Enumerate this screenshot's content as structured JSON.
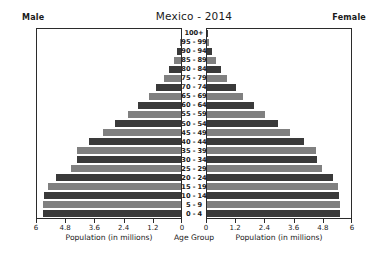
{
  "header": {
    "male_label": "Male",
    "female_label": "Female",
    "title": "Mexico - 2014"
  },
  "axis": {
    "left_title": "Population (in millions)",
    "right_title": "Population (in millions)",
    "center_title": "Age Group",
    "left_ticks": [
      "6",
      "4.8",
      "3.6",
      "2.4",
      "1.2",
      "0"
    ],
    "right_ticks": [
      "0",
      "1.2",
      "2.4",
      "3.6",
      "4.8",
      "6"
    ]
  },
  "colors": {
    "bar_dark": "#3a3a3a",
    "bar_light": "#808080",
    "axis": "#2b2b2b",
    "background": "#ffffff",
    "text": "#1a1a1a"
  },
  "chart_data": {
    "type": "bar",
    "subtype": "population-pyramid",
    "title": "Mexico - 2014",
    "xlabel": "Population (in millions)",
    "ylabel": "Age Group",
    "xlim": [
      0,
      6
    ],
    "xticks": [
      0,
      1.2,
      2.4,
      3.6,
      4.8,
      6
    ],
    "grid": false,
    "legend": "none",
    "orientation": "horizontal",
    "left_series_name": "Male",
    "right_series_name": "Female",
    "categories": [
      "0 - 4",
      "5 - 9",
      "10 - 14",
      "15 - 19",
      "20 - 24",
      "25 - 29",
      "30 - 34",
      "35 - 39",
      "40 - 44",
      "45 - 49",
      "50 - 54",
      "55 - 59",
      "60 - 64",
      "65 - 69",
      "70 - 74",
      "75 - 79",
      "80 - 84",
      "85 - 89",
      "90 - 94",
      "95 - 99",
      "100+"
    ],
    "series": [
      {
        "name": "Male",
        "values": [
          5.75,
          5.75,
          5.7,
          5.55,
          5.2,
          4.6,
          4.35,
          4.35,
          3.85,
          3.25,
          2.75,
          2.2,
          1.8,
          1.35,
          1.05,
          0.72,
          0.5,
          0.3,
          0.15,
          0.05,
          0.02
        ]
      },
      {
        "name": "Female",
        "values": [
          5.55,
          5.55,
          5.5,
          5.45,
          5.25,
          4.8,
          4.6,
          4.55,
          4.05,
          3.45,
          2.95,
          2.4,
          1.95,
          1.5,
          1.2,
          0.85,
          0.6,
          0.38,
          0.2,
          0.07,
          0.03
        ]
      }
    ]
  }
}
